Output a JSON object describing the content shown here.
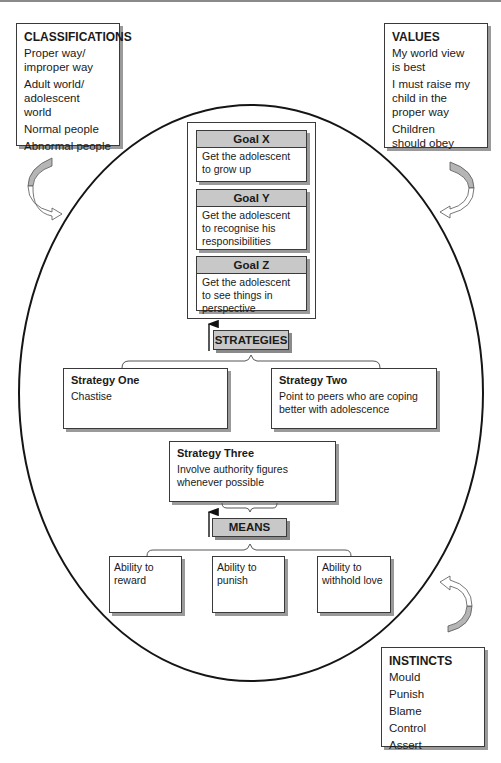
{
  "classifications": {
    "title": "CLASSIFICATIONS",
    "items": [
      "Proper way/ improper way",
      "Adult world/ adolescent world",
      "Normal people",
      "Abnormal people"
    ]
  },
  "values": {
    "title": "VALUES",
    "items": [
      "My world view is best",
      "I must raise my child in the proper way",
      "Children should obey"
    ]
  },
  "instincts": {
    "title": "INSTINCTS",
    "items": [
      "Mould",
      "Punish",
      "Blame",
      "Control",
      "Assert"
    ]
  },
  "goals": [
    {
      "title": "Goal X",
      "text": "Get the adolescent to grow up"
    },
    {
      "title": "Goal Y",
      "text": "Get the adolescent to recognise his responsibilities"
    },
    {
      "title": "Goal Z",
      "text": "Get the adolescent to see things in perspective"
    }
  ],
  "strategies_label": "STRATEGIES",
  "strategies": [
    {
      "title": "Strategy One",
      "text": "Chastise"
    },
    {
      "title": "Strategy Two",
      "text": "Point to peers who are coping better with adolescence"
    },
    {
      "title": "Strategy Three",
      "text": "Involve authority figures whenever possible"
    }
  ],
  "means_label": "MEANS",
  "means": [
    {
      "text": "Ability to reward"
    },
    {
      "text": "Ability to punish"
    },
    {
      "text": "Ability to withhold love"
    }
  ],
  "colors": {
    "label_fill": "#c8c8c8",
    "border": "#3a3a3a",
    "shadow": "#9a9a9a",
    "oval": "#151515"
  }
}
